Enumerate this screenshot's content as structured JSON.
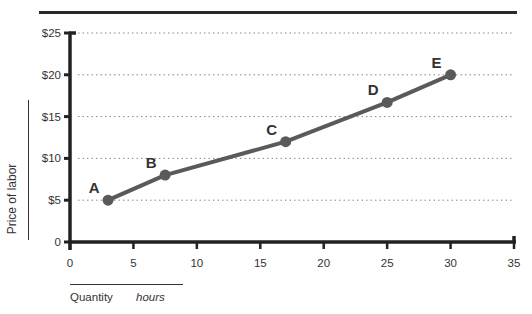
{
  "chart_data": {
    "type": "line",
    "xlabel": "Quantity",
    "xunit": "hours",
    "ylabel": "Price of labor",
    "xlim": [
      0,
      35
    ],
    "ylim": [
      0,
      25
    ],
    "x_ticks": [
      "0",
      "5",
      "10",
      "15",
      "20",
      "25",
      "30",
      "35"
    ],
    "y_ticks": [
      "0",
      "$5",
      "$10",
      "$15",
      "$20",
      "$25"
    ],
    "grid": "horizontal dotted",
    "series": [
      {
        "name": "Supply of labor",
        "color": "#5a5a5a",
        "points": [
          {
            "label": "A",
            "x": 3,
            "y": 5
          },
          {
            "label": "B",
            "x": 7.5,
            "y": 8
          },
          {
            "label": "C",
            "x": 17,
            "y": 12
          },
          {
            "label": "D",
            "x": 25,
            "y": 16.7
          },
          {
            "label": "E",
            "x": 30,
            "y": 20
          }
        ]
      }
    ]
  }
}
